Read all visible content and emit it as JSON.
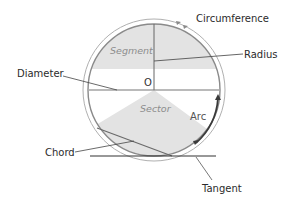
{
  "diagram": {
    "labels": {
      "circumference": "Circumference",
      "radius": "Radius",
      "diameter": "Diameter",
      "chord": "Chord",
      "tangent": "Tangent",
      "arc": "Arc",
      "segment": "Segment",
      "sector": "Sector",
      "center": "O"
    },
    "colors": {
      "line": "#555555",
      "circle_outline": "#8a8a8a",
      "outer_ring": "#a8a8a8",
      "region_fill": "#e3e3e3",
      "arc_highlight": "#3a3a3a",
      "text": "#2b2b2b"
    }
  }
}
